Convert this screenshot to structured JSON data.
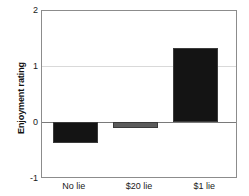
{
  "chart_data": {
    "type": "bar",
    "title": "",
    "subtitle": "",
    "xlabel": "",
    "ylabel": "Enjoyment rating",
    "categories": [
      "No lie",
      "$20 lie",
      "$1 lie"
    ],
    "values": [
      -0.39,
      -0.12,
      1.34
    ],
    "bar_colors": [
      "#141414",
      "#5c5c5c",
      "#141414"
    ],
    "ylim": [
      -1,
      2
    ],
    "yticks": [
      2,
      1,
      0,
      -1
    ],
    "ytick_labels": [
      "2",
      "1",
      "0",
      "-1"
    ],
    "grid": true,
    "gridlines_at": [
      1,
      0
    ],
    "legend": null,
    "legend_position": "none",
    "annotations": []
  },
  "axis": {
    "y_title": "Enjoyment rating",
    "tick_2": "2",
    "tick_1": "1",
    "tick_0": "0",
    "tick_neg1": "-1"
  },
  "categories": {
    "c0": "No lie",
    "c1": "$20 lie",
    "c2": "$1 lie"
  },
  "colors": {
    "bar_dark": "#141414",
    "bar_gray": "#5c5c5c",
    "frame": "#8c8c8c",
    "grid": "#d9d9d9",
    "zero": "#7a7a7a",
    "text": "#1a1a1a",
    "background": "#ffffff"
  }
}
